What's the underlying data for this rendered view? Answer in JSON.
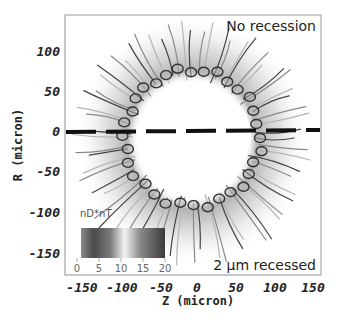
{
  "chart_data": {
    "type": "heatmap",
    "title": "",
    "xlabel": "Z (micron)",
    "ylabel": "R (micron)",
    "x_ticks": [
      -150,
      -100,
      -50,
      0,
      50,
      100,
      150
    ],
    "y_ticks": [
      100,
      50,
      0,
      -50,
      -100,
      -150
    ],
    "xlim": [
      -165,
      157
    ],
    "ylim": [
      -178,
      143
    ],
    "annotations": {
      "top_right": "No recession",
      "bottom_right": "2 µm recessed"
    },
    "colorbar": {
      "label": "nD*nT",
      "ticks": [
        0,
        5,
        10,
        15,
        20
      ],
      "range": [
        0,
        20
      ],
      "stops": [
        {
          "value": 0,
          "gray": "#8a8a8a"
        },
        {
          "value": 3,
          "gray": "#4a4a4a"
        },
        {
          "value": 7,
          "gray": "#777777"
        },
        {
          "value": 11,
          "gray": "#f2f2f2"
        },
        {
          "value": 14,
          "gray": "#8c8c8c"
        },
        {
          "value": 20,
          "gray": "#3a3a3a"
        }
      ]
    },
    "divider": {
      "style": "dashed",
      "y_value": 0,
      "note": "separates upper (no recession) and lower (2 µm recessed) halves"
    },
    "ring": {
      "description": "annular capsule perturbation contours with Rayleigh-Taylor spikes/bubbles",
      "center_z": 0,
      "center_r": -3,
      "inner_radius_approx": 65,
      "outer_radius_approx": 140
    }
  },
  "labels": {
    "x_ticks": [
      "-150",
      "-100",
      "-50",
      "0",
      "50",
      "100",
      "150"
    ],
    "y_ticks": [
      "100",
      "50",
      "0",
      "-50",
      "-100",
      "-150"
    ],
    "xlabel": "Z (micron)",
    "ylabel": "R (micron)",
    "top_annotation": "No recession",
    "bottom_annotation": "2 µm recessed",
    "colorbar_label": "nD*nT",
    "colorbar_ticks": [
      "0",
      "5",
      "10",
      "15",
      "20"
    ]
  }
}
